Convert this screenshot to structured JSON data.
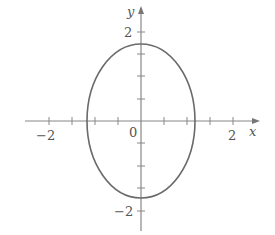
{
  "diagram": {
    "type": "ellipse-plot",
    "axes": {
      "x_label": "x",
      "y_label": "y",
      "origin_label": "0",
      "x_tick_labels": [
        "−2",
        "2"
      ],
      "y_tick_labels": [
        "2",
        "−2"
      ],
      "tick_step": 0.5,
      "x_range": [
        -2.5,
        2.5
      ],
      "y_range": [
        -2.5,
        2.5
      ]
    },
    "curve": {
      "shape": "ellipse",
      "center": [
        0,
        0
      ],
      "semi_axis_x": 1.17,
      "semi_axis_y": 1.73
    },
    "colors": {
      "axis": "#777777",
      "curve": "#666666",
      "text": "#555555"
    }
  }
}
